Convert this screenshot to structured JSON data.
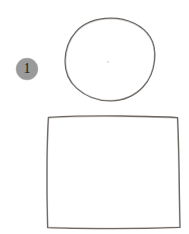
{
  "figure": {
    "background_color": "#ffffff",
    "width": 189,
    "height": 234,
    "ink_color": "#6b6560",
    "callouts": [
      {
        "label": "1",
        "shape": "filled-circle",
        "fill_color": "#9a9a9a",
        "text_color": "#1c1c1c",
        "center_x": 27,
        "center_y": 69,
        "radius": 11
      }
    ],
    "shapes": [
      {
        "name": "circle",
        "style": "hand-drawn outline",
        "stroke_color": "#6b6560",
        "stroke_width": 1.3,
        "fill": "none",
        "center_x": 110,
        "center_y": 59.5,
        "radius_x": 45,
        "radius_y": 41.5,
        "bounds": {
          "left": 65,
          "top": 18,
          "right": 155,
          "bottom": 101
        }
      },
      {
        "name": "square",
        "style": "hand-drawn outline",
        "stroke_color": "#6b6560",
        "stroke_width": 1.4,
        "fill": "none",
        "bounds": {
          "left": 47,
          "top": 116,
          "right": 180,
          "bottom": 228
        },
        "corners": [
          {
            "x": 48,
            "y": 116
          },
          {
            "x": 178,
            "y": 117
          },
          {
            "x": 180,
            "y": 228
          },
          {
            "x": 47,
            "y": 228
          }
        ]
      }
    ],
    "artifacts": [
      {
        "name": "speck",
        "x": 108,
        "y": 62,
        "radius": 0.9,
        "color": "#d8d4d0"
      }
    ]
  }
}
